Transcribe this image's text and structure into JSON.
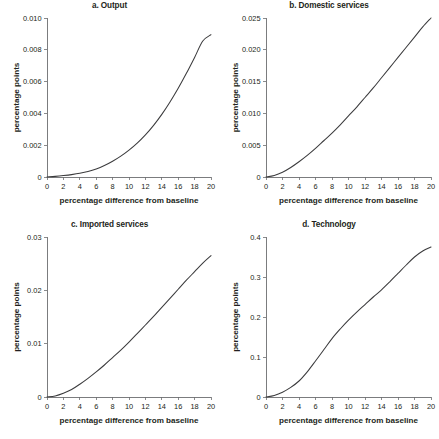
{
  "figure": {
    "panel_count": 4,
    "line_color": "#3b3b3d",
    "axis_color": "#6d6e70",
    "background": "#ffffff"
  },
  "chart_data": [
    {
      "type": "line",
      "title": "a. Output",
      "xlabel": "percentage difference from baseline",
      "ylabel": "percentage points",
      "xlim": [
        0,
        20
      ],
      "ylim": [
        0,
        0.01
      ],
      "grid": false,
      "legend": null,
      "xticks": [
        0,
        2,
        4,
        6,
        8,
        10,
        12,
        14,
        16,
        18,
        20
      ],
      "xtick_labels": [
        "0",
        "2",
        "4",
        "6",
        "8",
        "10",
        "12",
        "14",
        "16",
        "18",
        "20"
      ],
      "yticks": [
        0,
        0.002,
        0.004,
        0.006,
        0.008,
        0.01
      ],
      "ytick_labels": [
        "0",
        "0.002",
        "0.004",
        "0.006",
        "0.008",
        "0.010"
      ],
      "x": [
        0,
        1,
        2,
        3,
        4,
        5,
        6,
        7,
        8,
        9,
        10,
        11,
        12,
        13,
        14,
        15,
        16,
        17,
        18,
        19,
        20
      ],
      "values": [
        0,
        4e-05,
        9e-05,
        0.00015,
        0.00023,
        0.00034,
        0.0005,
        0.00072,
        0.00099,
        0.00131,
        0.00169,
        0.00213,
        0.00265,
        0.00325,
        0.00394,
        0.00472,
        0.00558,
        0.00652,
        0.00752,
        0.00855,
        0.00895
      ]
    },
    {
      "type": "line",
      "title": "b. Domestic services",
      "xlabel": "percentage difference from baseline",
      "ylabel": "percentage points",
      "xlim": [
        0,
        20
      ],
      "ylim": [
        0,
        0.025
      ],
      "grid": false,
      "legend": null,
      "xticks": [
        0,
        2,
        4,
        6,
        8,
        10,
        12,
        14,
        16,
        18,
        20
      ],
      "xtick_labels": [
        "0",
        "2",
        "4",
        "6",
        "8",
        "10",
        "12",
        "14",
        "16",
        "18",
        "20"
      ],
      "yticks": [
        0,
        0.005,
        0.01,
        0.015,
        0.02,
        0.025
      ],
      "ytick_labels": [
        "0",
        "0.005",
        "0.010",
        "0.015",
        "0.020",
        "0.025"
      ],
      "x": [
        0,
        1,
        2,
        3,
        4,
        5,
        6,
        7,
        8,
        9,
        10,
        11,
        12,
        13,
        14,
        15,
        16,
        17,
        18,
        19,
        20
      ],
      "values": [
        0,
        0.00025,
        0.00075,
        0.0015,
        0.0024,
        0.0034,
        0.0045,
        0.0057,
        0.0069,
        0.0082,
        0.0096,
        0.011,
        0.0125,
        0.014,
        0.0156,
        0.0172,
        0.0188,
        0.0204,
        0.022,
        0.0236,
        0.025
      ]
    },
    {
      "type": "line",
      "title": "c. Imported services",
      "xlabel": "percentage difference from baseline",
      "ylabel": "percentage points",
      "xlim": [
        0,
        20
      ],
      "ylim": [
        0,
        0.03
      ],
      "grid": false,
      "legend": null,
      "xticks": [
        0,
        2,
        4,
        6,
        8,
        10,
        12,
        14,
        16,
        18,
        20
      ],
      "xtick_labels": [
        "0",
        "2",
        "4",
        "6",
        "8",
        "10",
        "12",
        "14",
        "16",
        "18",
        "20"
      ],
      "yticks": [
        0,
        0.01,
        0.02,
        0.03
      ],
      "ytick_labels": [
        "0",
        "0.01",
        "0.02",
        "0.03"
      ],
      "x": [
        0,
        1,
        2,
        3,
        4,
        5,
        6,
        7,
        8,
        9,
        10,
        11,
        12,
        13,
        14,
        15,
        16,
        17,
        18,
        19,
        20
      ],
      "values": [
        0,
        0.0002,
        0.0007,
        0.0014,
        0.0024,
        0.0035,
        0.0047,
        0.006,
        0.0074,
        0.0088,
        0.0103,
        0.0119,
        0.0135,
        0.0151,
        0.0168,
        0.0185,
        0.0202,
        0.0219,
        0.0235,
        0.0251,
        0.0265
      ]
    },
    {
      "type": "line",
      "title": "d. Technology",
      "xlabel": "percentage difference from baseline",
      "ylabel": "percentage points",
      "xlim": [
        0,
        20
      ],
      "ylim": [
        0,
        0.4
      ],
      "grid": false,
      "legend": null,
      "xticks": [
        0,
        2,
        4,
        6,
        8,
        10,
        12,
        14,
        16,
        18,
        20
      ],
      "xtick_labels": [
        "0",
        "2",
        "4",
        "6",
        "8",
        "10",
        "12",
        "14",
        "16",
        "18",
        "20"
      ],
      "yticks": [
        0,
        0.1,
        0.2,
        0.3,
        0.4
      ],
      "ytick_labels": [
        "0",
        "0.1",
        "0.2",
        "0.3",
        "0.4"
      ],
      "x": [
        0,
        1,
        2,
        3,
        4,
        5,
        6,
        7,
        8,
        9,
        10,
        11,
        12,
        13,
        14,
        15,
        16,
        17,
        18,
        19,
        20
      ],
      "values": [
        0,
        0.004,
        0.012,
        0.024,
        0.04,
        0.063,
        0.09,
        0.118,
        0.146,
        0.17,
        0.192,
        0.212,
        0.231,
        0.25,
        0.268,
        0.288,
        0.309,
        0.33,
        0.35,
        0.365,
        0.375
      ]
    }
  ]
}
